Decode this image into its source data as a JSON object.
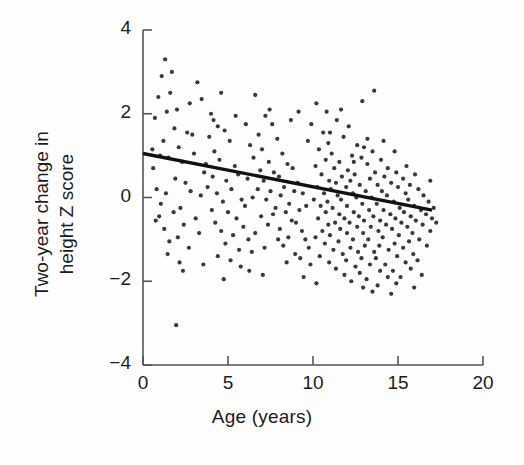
{
  "chart_data": {
    "type": "scatter",
    "title": "",
    "xlabel": "Age (years)",
    "ylabel": "Two-year change in height Z score",
    "ylabel_line1": "Two-year change in",
    "ylabel_line2": "height Z score",
    "xlim": [
      0,
      20
    ],
    "ylim": [
      -4,
      4
    ],
    "xticks": [
      0,
      5,
      10,
      15,
      20
    ],
    "yticks": [
      4,
      2,
      0,
      -2,
      -4
    ],
    "xtick_labels": [
      "0",
      "5",
      "10",
      "15",
      "20"
    ],
    "ytick_labels": [
      "4",
      "2",
      "0",
      "−2",
      "−4"
    ],
    "grid": false,
    "legend": "none",
    "point_color": "#3a3a3a",
    "line_color": "#111111",
    "axis_color": "#555555",
    "marker_size": 2.1,
    "n_points": 302,
    "series": [
      {
        "name": "Two-year change in height Z score vs age",
        "points": [
          [
            1.3,
            3.3
          ],
          [
            1.1,
            2.9
          ],
          [
            1.7,
            3.0
          ],
          [
            0.9,
            2.4
          ],
          [
            1.6,
            2.5
          ],
          [
            2.0,
            2.1
          ],
          [
            0.7,
            1.9
          ],
          [
            1.4,
            2.05
          ],
          [
            3.2,
            2.75
          ],
          [
            4.6,
            2.5
          ],
          [
            2.6,
            1.55
          ],
          [
            2.9,
            1.5
          ],
          [
            1.2,
            1.35
          ],
          [
            2.1,
            1.2
          ],
          [
            1.0,
            1.0
          ],
          [
            1.5,
            0.95
          ],
          [
            2.3,
            0.85
          ],
          [
            0.6,
            0.7
          ],
          [
            3.0,
            1.05
          ],
          [
            3.6,
            0.6
          ],
          [
            1.9,
            0.45
          ],
          [
            2.5,
            0.35
          ],
          [
            0.8,
            0.2
          ],
          [
            1.35,
            0.1
          ],
          [
            2.8,
            0.15
          ],
          [
            3.4,
            0.05
          ],
          [
            1.05,
            -0.15
          ],
          [
            2.2,
            -0.25
          ],
          [
            0.95,
            -0.45
          ],
          [
            1.8,
            -0.35
          ],
          [
            3.1,
            -0.5
          ],
          [
            2.4,
            -0.65
          ],
          [
            1.25,
            -0.75
          ],
          [
            0.75,
            -0.55
          ],
          [
            2.05,
            -0.95
          ],
          [
            3.3,
            -0.85
          ],
          [
            1.55,
            -1.05
          ],
          [
            2.7,
            -1.2
          ],
          [
            1.45,
            -1.35
          ],
          [
            2.15,
            -1.55
          ],
          [
            2.35,
            -1.75
          ],
          [
            1.95,
            -3.05
          ],
          [
            4.0,
            2.0
          ],
          [
            4.4,
            1.7
          ],
          [
            3.9,
            1.45
          ],
          [
            4.8,
            1.6
          ],
          [
            4.2,
            1.1
          ],
          [
            5.1,
            1.35
          ],
          [
            4.5,
            0.9
          ],
          [
            3.7,
            0.8
          ],
          [
            5.4,
            0.75
          ],
          [
            4.1,
            0.5
          ],
          [
            4.9,
            0.4
          ],
          [
            5.6,
            0.55
          ],
          [
            3.8,
            0.25
          ],
          [
            4.35,
            0.1
          ],
          [
            5.2,
            0.2
          ],
          [
            4.7,
            -0.1
          ],
          [
            5.8,
            -0.05
          ],
          [
            4.05,
            -0.3
          ],
          [
            5.0,
            -0.35
          ],
          [
            5.5,
            -0.5
          ],
          [
            4.25,
            -0.6
          ],
          [
            6.0,
            -0.2
          ],
          [
            4.6,
            -0.8
          ],
          [
            5.3,
            -0.9
          ],
          [
            5.9,
            -0.7
          ],
          [
            4.85,
            -1.1
          ],
          [
            5.65,
            -1.25
          ],
          [
            6.2,
            -1.0
          ],
          [
            4.4,
            -1.4
          ],
          [
            5.15,
            -1.5
          ],
          [
            6.4,
            -1.3
          ],
          [
            5.75,
            -1.65
          ],
          [
            6.6,
            2.45
          ],
          [
            7.2,
            1.95
          ],
          [
            6.8,
            1.5
          ],
          [
            7.6,
            1.75
          ],
          [
            6.3,
            1.25
          ],
          [
            7.0,
            1.15
          ],
          [
            7.9,
            1.4
          ],
          [
            6.5,
            0.95
          ],
          [
            7.4,
            0.85
          ],
          [
            8.2,
            1.05
          ],
          [
            6.9,
            0.65
          ],
          [
            7.7,
            0.6
          ],
          [
            8.5,
            0.8
          ],
          [
            6.15,
            0.45
          ],
          [
            7.1,
            0.4
          ],
          [
            8.0,
            0.5
          ],
          [
            8.8,
            0.7
          ],
          [
            6.75,
            0.2
          ],
          [
            7.5,
            0.15
          ],
          [
            8.3,
            0.25
          ],
          [
            9.1,
            0.35
          ],
          [
            6.45,
            0.0
          ],
          [
            7.25,
            -0.05
          ],
          [
            8.1,
            0.05
          ],
          [
            8.9,
            0.15
          ],
          [
            7.8,
            -0.25
          ],
          [
            8.6,
            -0.15
          ],
          [
            9.4,
            0.1
          ],
          [
            6.95,
            -0.45
          ],
          [
            7.65,
            -0.4
          ],
          [
            8.4,
            -0.35
          ],
          [
            9.2,
            -0.3
          ],
          [
            7.35,
            -0.65
          ],
          [
            8.75,
            -0.55
          ],
          [
            9.6,
            -0.2
          ],
          [
            6.6,
            -0.85
          ],
          [
            8.05,
            -0.75
          ],
          [
            9.0,
            -0.6
          ],
          [
            7.95,
            -1.0
          ],
          [
            8.55,
            -0.95
          ],
          [
            9.35,
            -0.8
          ],
          [
            7.15,
            -1.2
          ],
          [
            8.25,
            -1.15
          ],
          [
            9.55,
            -1.0
          ],
          [
            8.95,
            -1.35
          ],
          [
            9.75,
            -1.2
          ],
          [
            8.45,
            -1.55
          ],
          [
            9.25,
            -1.45
          ],
          [
            9.85,
            -1.6
          ],
          [
            10.2,
            2.25
          ],
          [
            11.4,
            1.85
          ],
          [
            10.6,
            1.55
          ],
          [
            12.1,
            1.7
          ],
          [
            10.9,
            1.3
          ],
          [
            11.8,
            1.45
          ],
          [
            12.6,
            1.25
          ],
          [
            10.35,
            1.15
          ],
          [
            11.1,
            1.05
          ],
          [
            12.3,
            1.0
          ],
          [
            13.0,
            1.2
          ],
          [
            10.75,
            0.9
          ],
          [
            11.55,
            0.85
          ],
          [
            12.85,
            0.95
          ],
          [
            13.5,
            1.1
          ],
          [
            10.15,
            0.75
          ],
          [
            11.25,
            0.7
          ],
          [
            12.05,
            0.65
          ],
          [
            13.2,
            0.8
          ],
          [
            14.0,
            0.9
          ],
          [
            10.5,
            0.55
          ],
          [
            11.7,
            0.5
          ],
          [
            12.45,
            0.55
          ],
          [
            13.65,
            0.6
          ],
          [
            14.4,
            0.7
          ],
          [
            10.95,
            0.4
          ],
          [
            11.35,
            0.35
          ],
          [
            12.2,
            0.4
          ],
          [
            13.35,
            0.45
          ],
          [
            14.2,
            0.5
          ],
          [
            14.9,
            0.6
          ],
          [
            10.25,
            0.25
          ],
          [
            11.05,
            0.2
          ],
          [
            11.95,
            0.25
          ],
          [
            12.75,
            0.3
          ],
          [
            13.8,
            0.3
          ],
          [
            14.6,
            0.35
          ],
          [
            15.3,
            0.45
          ],
          [
            10.65,
            0.1
          ],
          [
            11.45,
            0.05
          ],
          [
            12.35,
            0.1
          ],
          [
            13.1,
            0.15
          ],
          [
            14.05,
            0.15
          ],
          [
            15.0,
            0.25
          ],
          [
            15.7,
            0.3
          ],
          [
            10.05,
            -0.05
          ],
          [
            10.85,
            -0.1
          ],
          [
            11.65,
            -0.05
          ],
          [
            12.55,
            0.0
          ],
          [
            13.45,
            0.0
          ],
          [
            14.35,
            0.05
          ],
          [
            15.45,
            0.1
          ],
          [
            16.2,
            0.2
          ],
          [
            10.45,
            -0.2
          ],
          [
            11.15,
            -0.25
          ],
          [
            12.0,
            -0.2
          ],
          [
            12.9,
            -0.15
          ],
          [
            13.75,
            -0.15
          ],
          [
            14.75,
            -0.1
          ],
          [
            15.6,
            -0.05
          ],
          [
            16.5,
            0.05
          ],
          [
            10.75,
            -0.35
          ],
          [
            11.55,
            -0.4
          ],
          [
            12.4,
            -0.35
          ],
          [
            13.3,
            -0.3
          ],
          [
            14.15,
            -0.3
          ],
          [
            15.1,
            -0.25
          ],
          [
            15.95,
            -0.2
          ],
          [
            16.8,
            -0.1
          ],
          [
            10.3,
            -0.5
          ],
          [
            11.85,
            -0.5
          ],
          [
            12.7,
            -0.45
          ],
          [
            13.55,
            -0.45
          ],
          [
            14.55,
            -0.4
          ],
          [
            15.35,
            -0.35
          ],
          [
            16.35,
            -0.3
          ],
          [
            17.1,
            -0.25
          ],
          [
            10.9,
            -0.65
          ],
          [
            11.3,
            -0.6
          ],
          [
            12.15,
            -0.6
          ],
          [
            13.0,
            -0.55
          ],
          [
            13.95,
            -0.55
          ],
          [
            14.85,
            -0.5
          ],
          [
            15.75,
            -0.45
          ],
          [
            16.65,
            -0.4
          ],
          [
            10.55,
            -0.8
          ],
          [
            11.6,
            -0.75
          ],
          [
            12.6,
            -0.7
          ],
          [
            13.4,
            -0.7
          ],
          [
            14.3,
            -0.65
          ],
          [
            15.2,
            -0.6
          ],
          [
            16.05,
            -0.55
          ],
          [
            17.0,
            -0.5
          ],
          [
            10.15,
            -0.95
          ],
          [
            11.0,
            -0.9
          ],
          [
            12.0,
            -0.85
          ],
          [
            12.95,
            -0.85
          ],
          [
            13.85,
            -0.8
          ],
          [
            14.65,
            -0.75
          ],
          [
            15.55,
            -0.7
          ],
          [
            16.45,
            -0.65
          ],
          [
            10.7,
            -1.1
          ],
          [
            11.5,
            -1.05
          ],
          [
            12.35,
            -1.0
          ],
          [
            13.25,
            -1.0
          ],
          [
            14.1,
            -0.95
          ],
          [
            15.05,
            -0.9
          ],
          [
            15.85,
            -0.85
          ],
          [
            16.9,
            -0.8
          ],
          [
            11.2,
            -1.25
          ],
          [
            12.2,
            -1.2
          ],
          [
            13.05,
            -1.15
          ],
          [
            13.9,
            -1.15
          ],
          [
            14.8,
            -1.1
          ],
          [
            15.65,
            -1.05
          ],
          [
            16.25,
            -1.0
          ],
          [
            10.4,
            -1.4
          ],
          [
            11.75,
            -1.35
          ],
          [
            12.65,
            -1.3
          ],
          [
            13.6,
            -1.3
          ],
          [
            14.45,
            -1.25
          ],
          [
            15.3,
            -1.2
          ],
          [
            16.7,
            -1.15
          ],
          [
            10.95,
            -1.55
          ],
          [
            11.95,
            -1.5
          ],
          [
            12.85,
            -1.45
          ],
          [
            13.7,
            -1.45
          ],
          [
            14.95,
            -1.4
          ],
          [
            15.9,
            -1.35
          ],
          [
            11.35,
            -1.7
          ],
          [
            12.5,
            -1.65
          ],
          [
            13.35,
            -1.6
          ],
          [
            14.25,
            -1.6
          ],
          [
            15.45,
            -1.55
          ],
          [
            16.15,
            -1.5
          ],
          [
            11.85,
            -1.85
          ],
          [
            12.75,
            -1.8
          ],
          [
            13.95,
            -1.75
          ],
          [
            14.7,
            -1.75
          ],
          [
            15.75,
            -1.7
          ],
          [
            12.25,
            -2.0
          ],
          [
            13.15,
            -1.95
          ],
          [
            14.4,
            -1.9
          ],
          [
            15.15,
            -1.9
          ],
          [
            16.4,
            -1.85
          ],
          [
            12.95,
            -2.15
          ],
          [
            13.8,
            -2.1
          ],
          [
            14.9,
            -2.05
          ],
          [
            15.95,
            -2.15
          ],
          [
            13.5,
            -2.25
          ],
          [
            14.6,
            -2.3
          ],
          [
            12.4,
            0.85
          ],
          [
            11.0,
            1.55
          ],
          [
            13.2,
            1.4
          ],
          [
            14.8,
            1.1
          ],
          [
            9.9,
            1.75
          ],
          [
            10.8,
            2.05
          ],
          [
            12.9,
            2.3
          ],
          [
            15.5,
            0.75
          ],
          [
            16.0,
            0.55
          ],
          [
            16.9,
            0.4
          ],
          [
            17.25,
            -0.6
          ],
          [
            9.7,
            1.35
          ],
          [
            8.7,
            1.85
          ],
          [
            6.05,
            1.75
          ],
          [
            5.45,
            1.95
          ],
          [
            3.45,
            2.35
          ],
          [
            2.75,
            2.25
          ],
          [
            1.85,
            1.65
          ],
          [
            0.55,
            1.15
          ],
          [
            4.15,
            1.85
          ],
          [
            7.45,
            2.1
          ],
          [
            13.6,
            2.55
          ],
          [
            9.15,
            2.05
          ],
          [
            11.65,
            2.1
          ],
          [
            14.15,
            1.35
          ],
          [
            6.25,
            -1.75
          ],
          [
            7.05,
            -1.85
          ],
          [
            4.75,
            -1.95
          ],
          [
            3.55,
            -1.6
          ],
          [
            9.45,
            -1.9
          ],
          [
            10.2,
            -2.05
          ]
        ]
      }
    ],
    "trendline": {
      "name": "linear fit",
      "x": [
        0,
        17
      ],
      "y": [
        1.05,
        -0.3
      ],
      "slope": -0.079,
      "intercept": 1.05
    }
  }
}
